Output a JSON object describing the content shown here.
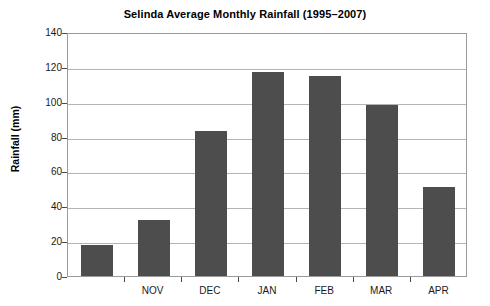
{
  "chart_data": {
    "type": "bar",
    "title": "Selinda Average Monthly Rainfall (1995–2007)",
    "xlabel": "",
    "ylabel": "Rainfall (mm)",
    "categories": [
      "",
      "NOV",
      "DEC",
      "JAN",
      "FEB",
      "MAR",
      "APR"
    ],
    "values": [
      18,
      32,
      83,
      117,
      115,
      98,
      51
    ],
    "ylim": [
      0,
      140
    ],
    "ytick_step": 20,
    "yticks": [
      0,
      20,
      40,
      60,
      80,
      100,
      120,
      140
    ],
    "ytick_labels": [
      "0",
      "20",
      "40",
      "60",
      "80",
      "100",
      "120",
      "140"
    ],
    "grid": "horizontal",
    "legend": "none",
    "bar_color": "#4d4d4d",
    "gridline_color": "#b4b4b4",
    "plot_border_color": "#9a9a9a",
    "background_color": "#ffffff"
  }
}
